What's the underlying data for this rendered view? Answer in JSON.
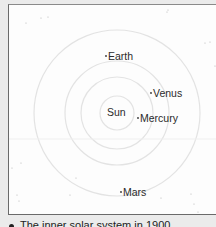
{
  "diagram": {
    "title": "The inner solar system in 1900",
    "center": {
      "x": 117,
      "y": 113
    },
    "orbits": [
      {
        "name": "Mercury",
        "r": 17
      },
      {
        "name": "Venus",
        "r": 36
      },
      {
        "name": "Earth",
        "r": 52
      },
      {
        "name": "Mars",
        "r": 83
      }
    ],
    "bodies": [
      {
        "name": "Sun",
        "label": "Sun",
        "label_x": 107,
        "label_y": 107,
        "dot": false
      },
      {
        "name": "Earth",
        "label": "Earth",
        "dot_x": 106,
        "dot_y": 56,
        "label_x": 108,
        "label_y": 51,
        "dot": true
      },
      {
        "name": "Venus",
        "label": "Venus",
        "dot_x": 151,
        "dot_y": 93,
        "label_x": 153,
        "label_y": 88,
        "dot": true
      },
      {
        "name": "Mercury",
        "label": "Mercury",
        "dot_x": 138,
        "dot_y": 118,
        "label_x": 140,
        "label_y": 113,
        "dot": true
      },
      {
        "name": "Mars",
        "label": "Mars",
        "dot_x": 121,
        "dot_y": 192,
        "label_x": 123,
        "label_y": 187,
        "dot": true
      }
    ],
    "colors": {
      "orbit": "#e3e3e3",
      "text": "#2b2b2b",
      "background": "#fdfdfd",
      "page": "#ebebeb"
    }
  },
  "caption": {
    "text": "The inner solar system in 1900"
  }
}
